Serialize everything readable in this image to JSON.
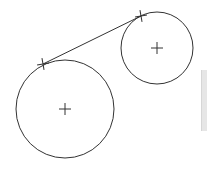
{
  "diagram": {
    "stroke_color": "#333333",
    "circles": [
      {
        "name": "large-circle",
        "cx": 65,
        "cy": 109,
        "r": 49
      },
      {
        "name": "small-circle",
        "cx": 157,
        "cy": 48,
        "r": 36
      }
    ],
    "center_markers": [
      {
        "name": "large-circle-center",
        "x": 65,
        "y": 109
      },
      {
        "name": "small-circle-center",
        "x": 157,
        "y": 48
      }
    ],
    "tangent_line": {
      "x1": 43,
      "y1": 64,
      "x2": 141,
      "y2": 16
    },
    "tangent_point_markers": [
      {
        "name": "tangent-point-large",
        "x": 43,
        "y": 64
      },
      {
        "name": "tangent-point-small",
        "x": 141,
        "y": 16
      }
    ],
    "side_panel_color": "#e6e6e6"
  }
}
